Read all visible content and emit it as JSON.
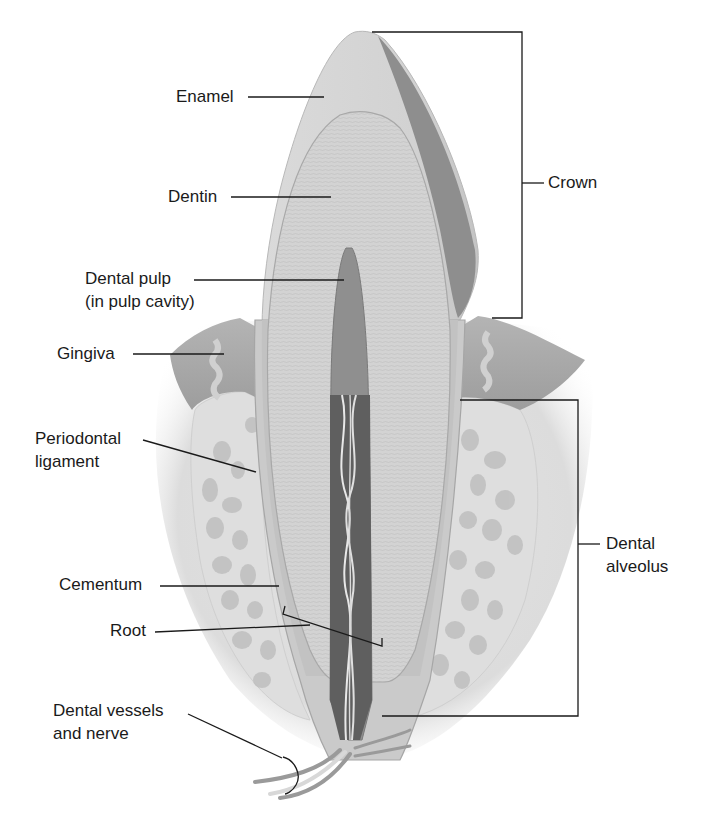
{
  "diagram": {
    "colors": {
      "background": "#ffffff",
      "label_text": "#1a1a1a",
      "leader_line": "#1a1a1a",
      "enamel": "#d9d9d9",
      "enamel_shadow": "#8a8a8a",
      "dentin": "#cfcfcf",
      "pulp": "#8f8f8f",
      "root_canal": "#6a6a6a",
      "gingiva": "#a9a9a9",
      "bone": "#e6e6e6",
      "bone_spaces": "#bdbdbd"
    },
    "labels": {
      "enamel": "Enamel",
      "dentin": "Dentin",
      "dental_pulp_line1": "Dental pulp",
      "dental_pulp_line2": "(in pulp cavity)",
      "gingiva": "Gingiva",
      "periodontal_line1": "Periodontal",
      "periodontal_line2": "ligament",
      "cementum": "Cementum",
      "root": "Root",
      "vessels_line1": "Dental vessels",
      "vessels_line2": "and nerve",
      "crown": "Crown",
      "alveolus_line1": "Dental",
      "alveolus_line2": "alveolus"
    },
    "brackets": [
      {
        "name": "crown",
        "top": 10,
        "bottom": 318
      },
      {
        "name": "dental-alveolus",
        "top": 400,
        "bottom": 716
      }
    ]
  }
}
